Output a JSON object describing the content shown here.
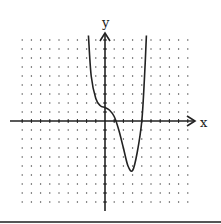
{
  "chart_data": {
    "type": "line",
    "title": "",
    "xlabel": "x",
    "ylabel": "y",
    "xlim": [
      -9,
      9
    ],
    "ylim": [
      -9,
      9
    ],
    "grid": "dotted",
    "series": [
      {
        "name": "f(x)",
        "points": [
          [
            -1.8,
            9.5
          ],
          [
            -1.5,
            5
          ],
          [
            -1,
            2.5
          ],
          [
            -0.5,
            1.7
          ],
          [
            0,
            1.5
          ],
          [
            0.5,
            1.2
          ],
          [
            1,
            0.5
          ],
          [
            1.5,
            -1
          ],
          [
            2,
            -3
          ],
          [
            2.5,
            -5
          ],
          [
            3,
            -5.5
          ],
          [
            3.5,
            -3.5
          ],
          [
            4,
            0
          ],
          [
            4.3,
            5
          ],
          [
            4.5,
            9.5
          ]
        ]
      }
    ]
  },
  "axes": {
    "x_label": "x",
    "y_label": "y"
  }
}
